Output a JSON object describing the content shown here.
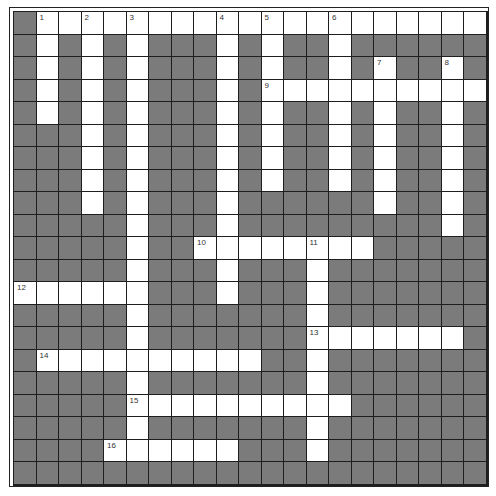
{
  "puzzle": {
    "rows": 21,
    "cols": 21,
    "colors": {
      "open_cell": "#ffffff",
      "block_cell": "#7b7b7b",
      "grid_line": "#1e1e1e"
    },
    "layout": [
      "#....................",
      "#.#.#.###.#.##.######",
      "#.#.#.###.#.##.#.##.#",
      "#.#.#.###.#..........",
      "#.#.#.###.#.##.#.##.#",
      "###.#.###.#.##.#.##.#",
      "###.#.###.#.##.#.##.#",
      "###.#.###.#.##.#.##.#",
      "###.#.###.######.##.#",
      "#####.###.#########.#",
      "#####.##........#####",
      "#####.###.###.#######",
      "......###.###.#######",
      "#####.#######.#######",
      "#####.#######.......#",
      "#..........##.#######",
      "#####.#######.#######",
      "#####..........######",
      "#####.#######.#######",
      "####......###.#######",
      "#####################"
    ],
    "numbers": [
      {
        "label": "1",
        "row": 0,
        "col": 1
      },
      {
        "label": "2",
        "row": 0,
        "col": 3
      },
      {
        "label": "3",
        "row": 0,
        "col": 5
      },
      {
        "label": "4",
        "row": 0,
        "col": 9
      },
      {
        "label": "5",
        "row": 0,
        "col": 11
      },
      {
        "label": "6",
        "row": 0,
        "col": 14
      },
      {
        "label": "7",
        "row": 2,
        "col": 16
      },
      {
        "label": "8",
        "row": 2,
        "col": 19
      },
      {
        "label": "9",
        "row": 3,
        "col": 11
      },
      {
        "label": "10",
        "row": 10,
        "col": 8
      },
      {
        "label": "11",
        "row": 10,
        "col": 13
      },
      {
        "label": "12",
        "row": 12,
        "col": 0
      },
      {
        "label": "13",
        "row": 14,
        "col": 13
      },
      {
        "label": "14",
        "row": 15,
        "col": 1
      },
      {
        "label": "15",
        "row": 17,
        "col": 5
      },
      {
        "label": "16",
        "row": 19,
        "col": 4
      }
    ],
    "entries": {
      "across": [
        {
          "number": "1",
          "row": 0,
          "col": 1,
          "length": 20
        },
        {
          "number": "9",
          "row": 3,
          "col": 11,
          "length": 10
        },
        {
          "number": "10",
          "row": 10,
          "col": 8,
          "length": 8
        },
        {
          "number": "12",
          "row": 12,
          "col": 0,
          "length": 6
        },
        {
          "number": "13",
          "row": 14,
          "col": 13,
          "length": 7
        },
        {
          "number": "14",
          "row": 15,
          "col": 1,
          "length": 10
        },
        {
          "number": "15",
          "row": 17,
          "col": 5,
          "length": 10
        },
        {
          "number": "16",
          "row": 19,
          "col": 4,
          "length": 6
        }
      ],
      "down": [
        {
          "number": "1",
          "row": 0,
          "col": 1,
          "length": 5
        },
        {
          "number": "2",
          "row": 0,
          "col": 3,
          "length": 9
        },
        {
          "number": "3",
          "row": 0,
          "col": 5,
          "length": 20
        },
        {
          "number": "4",
          "row": 0,
          "col": 9,
          "length": 13
        },
        {
          "number": "5",
          "row": 0,
          "col": 11,
          "length": 8
        },
        {
          "number": "6",
          "row": 0,
          "col": 14,
          "length": 8
        },
        {
          "number": "7",
          "row": 2,
          "col": 16,
          "length": 7
        },
        {
          "number": "8",
          "row": 2,
          "col": 19,
          "length": 8
        },
        {
          "number": "11",
          "row": 10,
          "col": 13,
          "length": 10
        }
      ]
    }
  }
}
